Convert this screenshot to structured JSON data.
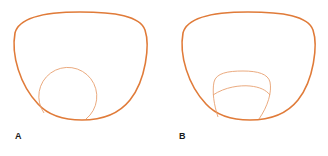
{
  "figure": {
    "panels": [
      {
        "label": "A",
        "segment_type": "round"
      },
      {
        "label": "B",
        "segment_type": "curved-top-with-dividing-line"
      }
    ],
    "colors": {
      "outer_lens": "#e07b39",
      "segment": "#e8a070",
      "label": "#1a1a1a",
      "background": "#ffffff"
    }
  }
}
